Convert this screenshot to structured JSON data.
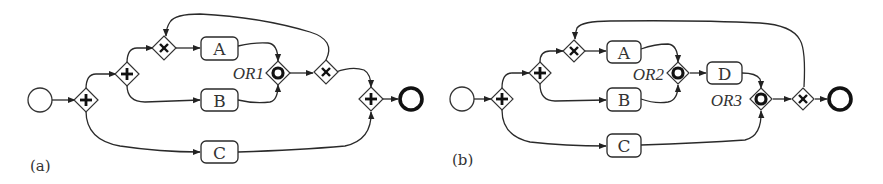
{
  "figure": {
    "type": "BPMN process model comparison",
    "colors": {
      "stroke": "#2a2a2a",
      "background": "#ffffff"
    }
  },
  "diagram_a": {
    "caption": "(a)",
    "nodes": {
      "start": {
        "type": "start-event",
        "cx": 40,
        "cy": 100
      },
      "and1": {
        "type": "parallel-gateway",
        "cx": 86,
        "cy": 100
      },
      "and2": {
        "type": "parallel-gateway",
        "cx": 127,
        "cy": 74
      },
      "xor1": {
        "type": "exclusive-gateway",
        "cx": 164,
        "cy": 48
      },
      "task_a": {
        "type": "task",
        "label": "A",
        "cx": 219,
        "cy": 48
      },
      "task_b": {
        "type": "task",
        "label": "B",
        "cx": 219,
        "cy": 100
      },
      "task_c": {
        "type": "task",
        "label": "C",
        "cx": 219,
        "cy": 152
      },
      "or1": {
        "type": "inclusive-gateway",
        "label": "OR1",
        "cx": 278,
        "cy": 73
      },
      "xor2": {
        "type": "exclusive-gateway",
        "cx": 325,
        "cy": 72
      },
      "and3": {
        "type": "parallel-gateway",
        "cx": 371,
        "cy": 99
      },
      "end": {
        "type": "end-event",
        "cx": 411,
        "cy": 99
      }
    },
    "edges": [
      [
        "start",
        "and1"
      ],
      [
        "and1",
        "and2"
      ],
      [
        "and1",
        "task_c"
      ],
      [
        "and2",
        "xor1"
      ],
      [
        "and2",
        "task_b"
      ],
      [
        "xor1",
        "task_a"
      ],
      [
        "task_a",
        "or1"
      ],
      [
        "task_b",
        "or1"
      ],
      [
        "or1",
        "xor2"
      ],
      [
        "xor2",
        "xor1"
      ],
      [
        "xor2",
        "and3"
      ],
      [
        "task_c",
        "and3"
      ],
      [
        "and3",
        "end"
      ]
    ]
  },
  "diagram_b": {
    "caption": "(b)",
    "nodes": {
      "start": {
        "type": "start-event",
        "cx": 462,
        "cy": 99
      },
      "and1": {
        "type": "parallel-gateway",
        "cx": 502,
        "cy": 99
      },
      "and2": {
        "type": "parallel-gateway",
        "cx": 540,
        "cy": 73
      },
      "xor1": {
        "type": "exclusive-gateway",
        "cx": 574,
        "cy": 51
      },
      "task_a": {
        "type": "task",
        "label": "A",
        "cx": 623,
        "cy": 52
      },
      "task_b": {
        "type": "task",
        "label": "B",
        "cx": 623,
        "cy": 99
      },
      "task_c": {
        "type": "task",
        "label": "C",
        "cx": 623,
        "cy": 146
      },
      "or2": {
        "type": "inclusive-gateway",
        "label": "OR2",
        "cx": 678,
        "cy": 73
      },
      "task_d": {
        "type": "task",
        "label": "D",
        "cx": 724,
        "cy": 73
      },
      "or3": {
        "type": "inclusive-gateway",
        "label": "OR3",
        "cx": 761,
        "cy": 99
      },
      "xor2": {
        "type": "exclusive-gateway",
        "cx": 803,
        "cy": 99
      },
      "end": {
        "type": "end-event",
        "cx": 840,
        "cy": 99
      }
    },
    "edges": [
      [
        "start",
        "and1"
      ],
      [
        "and1",
        "and2"
      ],
      [
        "and1",
        "task_c"
      ],
      [
        "and2",
        "xor1"
      ],
      [
        "and2",
        "task_b"
      ],
      [
        "xor1",
        "task_a"
      ],
      [
        "task_a",
        "or2"
      ],
      [
        "task_b",
        "or2"
      ],
      [
        "or2",
        "task_d"
      ],
      [
        "task_d",
        "or3"
      ],
      [
        "task_c",
        "or3"
      ],
      [
        "or3",
        "xor2"
      ],
      [
        "xor2",
        "xor1"
      ],
      [
        "xor2",
        "end"
      ]
    ]
  }
}
